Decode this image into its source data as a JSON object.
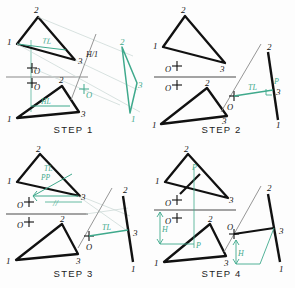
{
  "figure": {
    "colors": {
      "ink": "#111111",
      "teal": "#3fa98c",
      "thin_gray": "#8a8a8a",
      "paper": "#fdfdfd"
    },
    "vertex_labels": {
      "one": "1",
      "two": "2",
      "three": "3"
    },
    "point_label": "O",
    "pierce_label": "P"
  },
  "panels": [
    {
      "id": "step1",
      "caption": "STEP 1",
      "notes": "Top view and front view of plane 1-2-3 with point O; a horizontal line (HL) is drawn in the front view and projected to the top view where it appears true length (TL). Fold line H/1 is drawn perpendicular to the TL line and the plane projects as an edge in auxiliary view 1.",
      "labels": {
        "tl": "TL",
        "hl": "HL",
        "fold": "H/1",
        "point_top": "O",
        "point_front": "O",
        "point_aux": "O"
      },
      "top_triangle": {
        "v1": "1",
        "v2": "2",
        "v3": "3"
      },
      "front_triangle": {
        "v1": "1",
        "v2": "2",
        "v3": "3"
      },
      "aux_triangle": {
        "v1": "1",
        "v2": "2",
        "v3": "3"
      }
    },
    {
      "id": "step2",
      "caption": "STEP 2",
      "notes": "In the edge view the plane appears as a straight line; the perpendicular from point O to that edge view is the true length (TL) of the required distance. The piercing point P is located where the perpendicular meets the edge view.",
      "labels": {
        "tl": "TL",
        "p": "P",
        "point_front": "O",
        "point_top": "O",
        "point_aux": "O"
      },
      "top_triangle": {
        "v1": "1",
        "v2": "2",
        "v3": "3"
      },
      "front_triangle": {
        "v1": "1",
        "v2": "2",
        "v3": "3"
      },
      "edge_view": {
        "v1": "1",
        "v2": "2",
        "v3": "3"
      }
    },
    {
      "id": "step3",
      "caption": "STEP 3",
      "notes": "The true length perpendicular is projected back to the top view, where it is drawn parallel (//) to the fold line H/1, giving the top view of the perpendicular; PP marks the projected perpendicular and TL is transferred from the auxiliary view.",
      "labels": {
        "tl_top": "TL",
        "pp": "PP",
        "parallel": "//",
        "tl_aux": "TL",
        "point_top": "O",
        "point_front": "O",
        "point_aux": "O"
      },
      "top_triangle": {
        "v1": "1",
        "v2": "2",
        "v3": "3"
      },
      "front_triangle": {
        "v1": "1",
        "v2": "2",
        "v3": "3"
      },
      "edge_view": {
        "v1": "1",
        "v2": "2",
        "v3": "3"
      }
    },
    {
      "id": "step4",
      "caption": "STEP 4",
      "notes": "The piercing point P is transferred back to the top and front views by measuring the height H from the fold line in the auxiliary view. P is located in the top view and then projected into the front view.",
      "labels": {
        "p_top": "P",
        "p_front": "P",
        "h_front": "H",
        "h_aux": "H",
        "point_top": "O",
        "point_front": "O",
        "point_aux": "O"
      },
      "top_triangle": {
        "v1": "1",
        "v2": "2",
        "v3": "3"
      },
      "front_triangle": {
        "v1": "1",
        "v2": "2",
        "v3": "3"
      },
      "edge_view": {
        "v1": "1",
        "v2": "2",
        "v3": "3"
      }
    }
  ]
}
